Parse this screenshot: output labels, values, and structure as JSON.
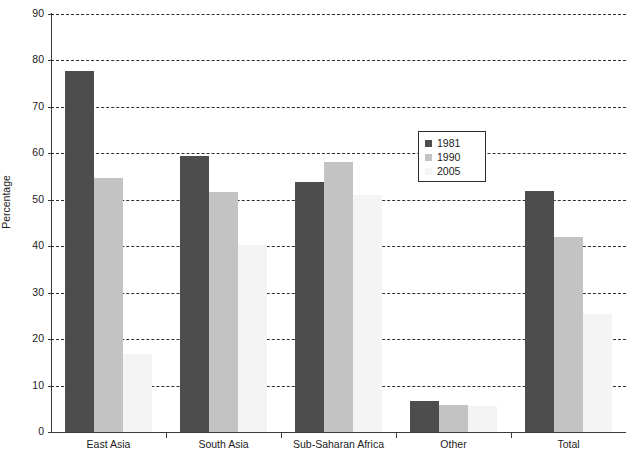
{
  "chart_data": {
    "type": "bar",
    "title": "",
    "xlabel": "",
    "ylabel": "Percentage",
    "ylim": [
      0,
      90
    ],
    "ytick_step": 10,
    "yticks": [
      0,
      10,
      20,
      30,
      40,
      50,
      60,
      70,
      80,
      90
    ],
    "grid": "horizontal-dashed",
    "legend_position": "upper-center-right",
    "categories": [
      "East Asia",
      "South Asia",
      "Sub-Saharan Africa",
      "Other",
      "Total"
    ],
    "series": [
      {
        "name": "1981",
        "color": "#4d4d4d",
        "values": [
          77.7,
          59.4,
          53.9,
          6.7,
          51.8
        ]
      },
      {
        "name": "1990",
        "color": "#c3c3c3",
        "values": [
          54.7,
          51.7,
          58.1,
          5.9,
          41.9
        ]
      },
      {
        "name": "2005",
        "color": "#f4f4f4",
        "values": [
          16.8,
          40.3,
          51.0,
          5.7,
          25.5
        ]
      }
    ]
  }
}
